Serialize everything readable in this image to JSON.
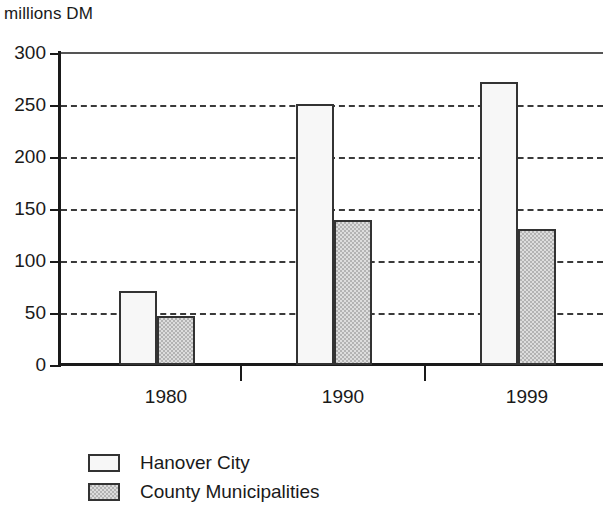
{
  "chart_data": {
    "type": "bar",
    "title": "",
    "subtitle": "",
    "unit_label": "millions DM",
    "xlabel": "",
    "ylabel": "millions DM",
    "categories": [
      "1980",
      "1990",
      "1999"
    ],
    "series": [
      {
        "name": "Hanover City",
        "color": "#f7f7f7",
        "values": [
          71,
          251,
          272
        ]
      },
      {
        "name": "County Municipalities",
        "color": "#b3b3b3",
        "values": [
          47,
          139,
          131
        ]
      }
    ],
    "ylim": [
      0,
      300
    ],
    "ytick_values": [
      0,
      50,
      100,
      150,
      200,
      250,
      300
    ],
    "ytick_labels": [
      "0",
      "50",
      "100",
      "150",
      "200",
      "250",
      "300"
    ],
    "grid": true,
    "grid_style": "dashed-horizontal",
    "legend_position": "bottom-left",
    "axis_color": "#1a1a1a",
    "grid_color": "#3a3a3a",
    "bar_border_color": "#333333"
  },
  "legend": {
    "items": [
      {
        "label": "Hanover City",
        "swatch": "legend-swatch-hanover-city"
      },
      {
        "label": "County Municipalities",
        "swatch": "legend-swatch-county-municipalities"
      }
    ]
  }
}
